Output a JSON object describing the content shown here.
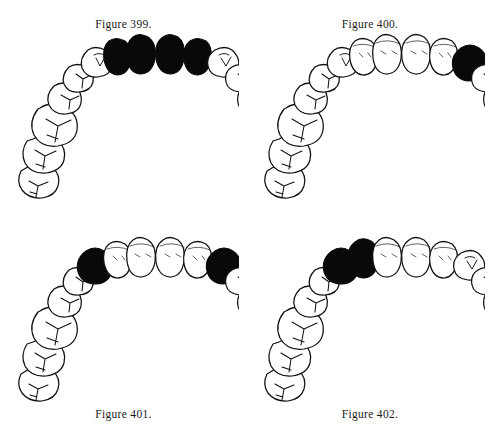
{
  "page": {
    "background_color": "#ffffff",
    "ink_color": "#111111",
    "fill_color": "#090909",
    "figure_count": 4
  },
  "figures": [
    {
      "id": "figure-399",
      "caption": "Figure 399.",
      "caption_position": "above",
      "arch": "maxillary",
      "view": "occlusal",
      "tooth_count": 16,
      "shaded_teeth": [
        "right-lateral-incisor",
        "right-central-incisor",
        "left-central-incisor",
        "left-lateral-incisor"
      ],
      "shaded_count": 4,
      "description": "Upper dental arch with the four incisors shaded black."
    },
    {
      "id": "figure-400",
      "caption": "Figure 400.",
      "caption_position": "above",
      "arch": "maxillary",
      "view": "occlusal",
      "tooth_count": 16,
      "shaded_teeth": [
        "left-canine"
      ],
      "shaded_count": 1,
      "description": "Upper dental arch with a single canine shaded black on the viewer's right side."
    },
    {
      "id": "figure-401",
      "caption": "Figure 401.",
      "caption_position": "below",
      "arch": "maxillary",
      "view": "occlusal",
      "tooth_count": 16,
      "shaded_teeth": [
        "right-canine",
        "left-canine"
      ],
      "shaded_count": 2,
      "description": "Upper dental arch with both canines shaded black."
    },
    {
      "id": "figure-402",
      "caption": "Figure 402.",
      "caption_position": "below",
      "arch": "maxillary",
      "view": "occlusal",
      "tooth_count": 16,
      "shaded_teeth": [
        "right-canine",
        "right-lateral-incisor"
      ],
      "shaded_count": 2,
      "description": "Upper dental arch with the canine and lateral incisor shaded black on the viewer's left side."
    }
  ],
  "tooth_names": [
    "right-third-molar",
    "right-second-molar",
    "right-first-molar",
    "right-second-premolar",
    "right-first-premolar",
    "right-canine",
    "right-lateral-incisor",
    "right-central-incisor",
    "left-central-incisor",
    "left-lateral-incisor",
    "left-canine",
    "left-first-premolar",
    "left-second-premolar",
    "left-first-molar",
    "left-second-molar",
    "left-third-molar"
  ]
}
